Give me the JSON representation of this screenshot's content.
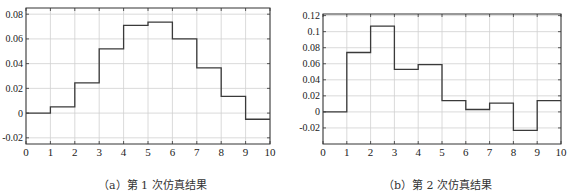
{
  "chart_data": [
    {
      "type": "line",
      "subtype": "step",
      "title": "",
      "caption": "（a）第 1 次仿真结果",
      "xlabel": "",
      "ylabel": "",
      "xlim": [
        0,
        10
      ],
      "ylim": [
        -0.025,
        0.085
      ],
      "xticks": [
        0,
        1,
        2,
        3,
        4,
        5,
        6,
        7,
        8,
        9,
        10
      ],
      "yticks": [
        -0.02,
        0,
        0.02,
        0.04,
        0.06,
        0.08
      ],
      "ytick_labels": [
        "-0.02",
        "0",
        "0.02",
        "0.04",
        "0.06",
        "0.08"
      ],
      "grid": true,
      "x": [
        0,
        1,
        2,
        3,
        4,
        5,
        6,
        7,
        8,
        9
      ],
      "values": [
        0,
        0.005,
        0.0245,
        0.052,
        0.071,
        0.0735,
        0.06,
        0.0365,
        0.0135,
        -0.005
      ]
    },
    {
      "type": "line",
      "subtype": "step",
      "title": "",
      "caption": "（b）第 2 次仿真结果",
      "xlabel": "",
      "ylabel": "",
      "xlim": [
        0,
        10
      ],
      "ylim": [
        -0.04,
        0.122
      ],
      "xticks": [
        0,
        1,
        2,
        3,
        4,
        5,
        6,
        7,
        8,
        9,
        10
      ],
      "yticks": [
        -0.02,
        0,
        0.02,
        0.04,
        0.06,
        0.08,
        0.1,
        0.12
      ],
      "ytick_labels": [
        "-0.02",
        "0",
        "0.02",
        "0.04",
        "0.06",
        "0.08",
        "0.1",
        "0.12"
      ],
      "grid": true,
      "x": [
        0,
        1,
        2,
        3,
        4,
        5,
        6,
        7,
        8,
        9
      ],
      "values": [
        0,
        0.074,
        0.107,
        0.053,
        0.059,
        0.014,
        0.003,
        0.011,
        -0.023,
        0.014
      ]
    }
  ],
  "captions": {
    "a": "（a）第 1 次仿真结果",
    "b": "（b）第 2 次仿真结果"
  }
}
